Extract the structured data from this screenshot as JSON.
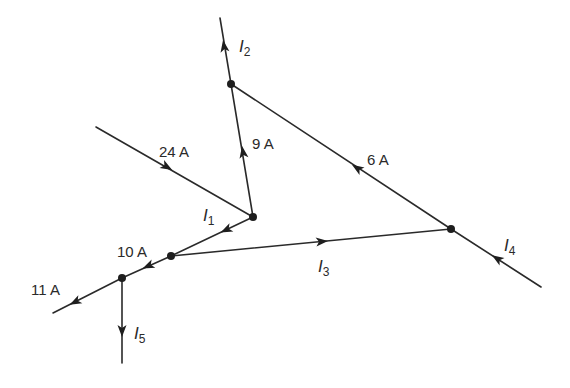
{
  "diagram": {
    "type": "kirchhoff-current-network",
    "nodes": [
      {
        "id": "top",
        "x": 231,
        "y": 84
      },
      {
        "id": "mid",
        "x": 253,
        "y": 217
      },
      {
        "id": "left",
        "x": 171,
        "y": 256
      },
      {
        "id": "bottom-left",
        "x": 122,
        "y": 278
      },
      {
        "id": "right",
        "x": 451,
        "y": 229
      }
    ],
    "branches": [
      {
        "id": "I2",
        "from": "top",
        "to_point": [
          220,
          18
        ],
        "direction": "out",
        "label": "I",
        "sub": "2"
      },
      {
        "id": "9A",
        "from": "mid",
        "to": "top",
        "label": "9 A"
      },
      {
        "id": "6A",
        "from": "right",
        "to": "top",
        "label": "6 A"
      },
      {
        "id": "24A",
        "from_point": [
          96,
          127
        ],
        "to": "mid",
        "label": "24 A"
      },
      {
        "id": "I1",
        "from": "mid",
        "to": "left",
        "label": "I",
        "sub": "1"
      },
      {
        "id": "I3",
        "from": "left",
        "to": "right",
        "label": "I",
        "sub": "3"
      },
      {
        "id": "I4",
        "from_point": [
          541,
          287
        ],
        "to": "right",
        "label": "I",
        "sub": "4"
      },
      {
        "id": "10A",
        "from": "left",
        "to": "bottom-left",
        "label": "10 A"
      },
      {
        "id": "11A",
        "from": "bottom-left",
        "to_point": [
          53,
          313
        ],
        "label": "11 A"
      },
      {
        "id": "I5",
        "from": "bottom-left",
        "to_point": [
          122,
          363
        ],
        "label": "I",
        "sub": "5"
      }
    ]
  },
  "labels": {
    "i2": {
      "var": "I",
      "sub": "2"
    },
    "nine_a": "9 A",
    "six_a": "6 A",
    "twentyfour_a": "24 A",
    "i1": {
      "var": "I",
      "sub": "1"
    },
    "i3": {
      "var": "I",
      "sub": "3"
    },
    "i4": {
      "var": "I",
      "sub": "4"
    },
    "ten_a": "10 A",
    "eleven_a": "11 A",
    "i5": {
      "var": "I",
      "sub": "5"
    }
  },
  "colors": {
    "line": "#2a2a2a",
    "node": "#1e1e1e",
    "background": "#ffffff"
  }
}
